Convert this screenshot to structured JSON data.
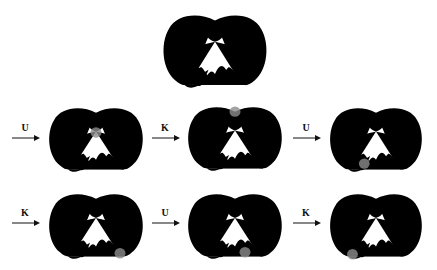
{
  "diagram": {
    "title": "",
    "stroke_color": "#111111",
    "highlight_color": "#8c8c8c",
    "original_knot": {
      "highlight": null
    },
    "steps": [
      {
        "move": "U",
        "highlight": "center-crossing"
      },
      {
        "move": "K",
        "highlight": "top-crossing"
      },
      {
        "move": "U",
        "highlight": "bottom-crossing-1"
      },
      {
        "move": "K",
        "highlight": "bottom-right-crossing"
      },
      {
        "move": "U",
        "highlight": "bottom-crossing-3"
      },
      {
        "move": "K",
        "highlight": "bottom-left-crossing"
      }
    ]
  }
}
